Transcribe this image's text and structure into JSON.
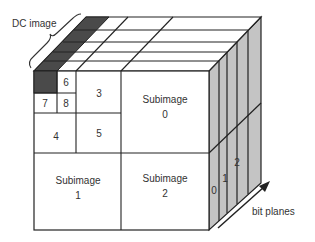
{
  "diagram": {
    "dc_label": "DC image",
    "bitplanes_label": "bit planes",
    "colors": {
      "line": "#222222",
      "dc_fill": "#4a4a4a",
      "side_fill": "#c4c4c4",
      "face_fill": "#ffffff",
      "text": "#333333"
    },
    "subbands": [
      {
        "id": "dc",
        "label": ""
      },
      {
        "id": "6",
        "label": "6"
      },
      {
        "id": "7",
        "label": "7"
      },
      {
        "id": "8",
        "label": "8"
      },
      {
        "id": "3",
        "label": "3"
      },
      {
        "id": "4",
        "label": "4"
      },
      {
        "id": "5",
        "label": "5"
      },
      {
        "id": "sub0",
        "label": "Subimage",
        "index": "0"
      },
      {
        "id": "sub1",
        "label": "Subimage",
        "index": "1"
      },
      {
        "id": "sub2",
        "label": "Subimage",
        "index": "2"
      }
    ],
    "bit_plane_labels": [
      "0",
      "1",
      "2"
    ]
  }
}
